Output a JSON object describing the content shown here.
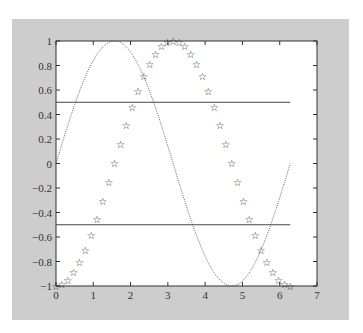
{
  "chart_data": {
    "type": "line",
    "title": "",
    "xlabel": "",
    "ylabel": "",
    "xlim": [
      0,
      7
    ],
    "ylim": [
      -1,
      1
    ],
    "grid": false,
    "legend": null,
    "xticks": [
      "0",
      "1",
      "2",
      "3",
      "4",
      "5",
      "6",
      "7"
    ],
    "yticks": [
      "-1",
      "-0.8",
      "-0.6",
      "-0.4",
      "-0.2",
      "0",
      "0.2",
      "0.4",
      "0.6",
      "0.8",
      "1"
    ],
    "series": [
      {
        "name": "sin(x)",
        "style": "dotted line",
        "color": "#555555",
        "function": "sin",
        "x_range": [
          0,
          6.2832
        ]
      },
      {
        "name": "-cos(x)",
        "style": "star markers",
        "color": "#222222",
        "function": "negcos",
        "x_range": [
          0,
          6.2832
        ],
        "points": 41,
        "step": 0.15708
      },
      {
        "name": "y=0.5",
        "style": "solid line",
        "color": "#444444",
        "y": 0.5,
        "x_range": [
          0,
          6.2832
        ]
      },
      {
        "name": "y=-0.5",
        "style": "solid line",
        "color": "#444444",
        "y": -0.5,
        "x_range": [
          0,
          6.2832
        ]
      }
    ]
  },
  "colors": {
    "figure_background": "#cdcdcd",
    "axes_background": "#ffffff",
    "axes_edge": "#333333"
  }
}
